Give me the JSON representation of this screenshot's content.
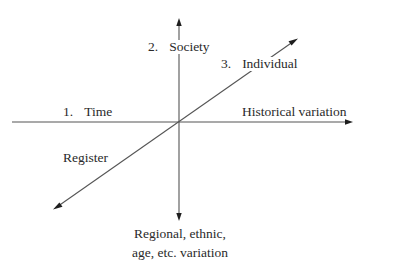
{
  "diagram": {
    "type": "three-axis variation model",
    "axes": {
      "time": {
        "number": "1.",
        "name": "Time",
        "dimension_label": "Historical variation"
      },
      "society": {
        "number": "2.",
        "name": "Society",
        "dimension_label_lines": [
          "Regional, ethnic,",
          "age, etc. variation"
        ]
      },
      "individual": {
        "number": "3.",
        "name": "Individual",
        "dimension_label": "Register"
      }
    },
    "colors": {
      "line": "#555555",
      "arrowhead": "#1e1e1e",
      "text": "#2a2a2a",
      "background": "#ffffff"
    }
  }
}
